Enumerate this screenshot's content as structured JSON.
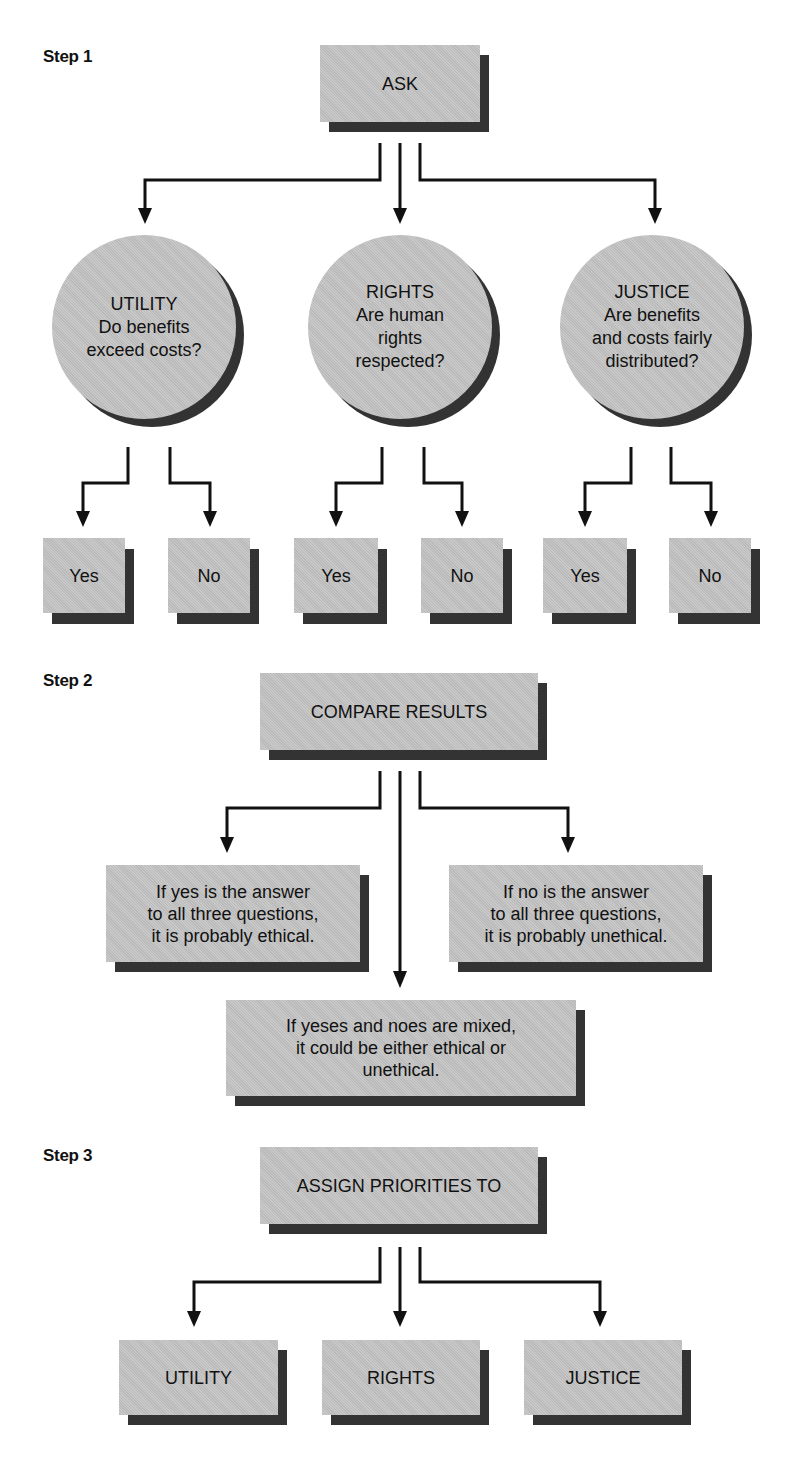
{
  "steps": [
    {
      "label": "Step 1"
    },
    {
      "label": "Step 2"
    },
    {
      "label": "Step 3"
    }
  ],
  "step1": {
    "ask": "ASK",
    "circles": [
      {
        "title": "UTILITY",
        "lines": [
          "Do benefits",
          "exceed costs?"
        ]
      },
      {
        "title": "RIGHTS",
        "lines": [
          "Are human",
          "rights",
          "respected?"
        ]
      },
      {
        "title": "JUSTICE",
        "lines": [
          "Are benefits",
          "and costs fairly",
          "distributed?"
        ]
      }
    ],
    "answers": [
      "Yes",
      "No",
      "Yes",
      "No",
      "Yes",
      "No"
    ]
  },
  "step2": {
    "compare": "COMPARE RESULTS",
    "all_yes": [
      "If yes is the answer",
      "to all three questions,",
      "it is probably ethical."
    ],
    "all_no": [
      "If no is the answer",
      "to all three questions,",
      "it is probably unethical."
    ],
    "mixed": [
      "If yeses and noes are mixed,",
      "it could be either ethical or",
      "unethical."
    ]
  },
  "step3": {
    "assign": "ASSIGN PRIORITIES TO",
    "priorities": [
      "UTILITY",
      "RIGHTS",
      "JUSTICE"
    ]
  },
  "colors": {
    "box_face": "#c4c4c4",
    "shadow": "#333333",
    "line": "#111111"
  }
}
